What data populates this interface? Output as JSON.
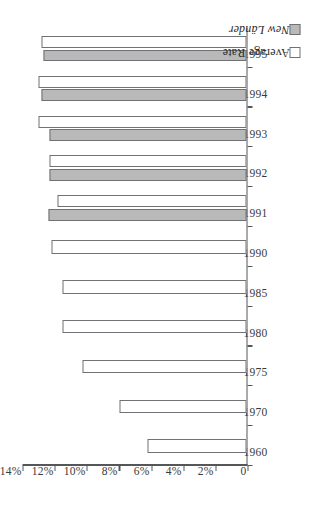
{
  "chart_data": {
    "type": "bar",
    "title": "",
    "subtitle": "",
    "xlabel": "",
    "ylabel": "",
    "orientation": "horizontal-rotated",
    "categories": [
      "1960",
      "1970",
      "1975",
      "1980",
      "1985",
      "1990",
      "1991",
      "1992",
      "1993",
      "1994",
      "1995"
    ],
    "series": [
      {
        "name": "Average Rate",
        "color": "#ffffff",
        "values": [
          6.1,
          7.9,
          10.2,
          11.4,
          11.4,
          12.1,
          11.7,
          12.25,
          12.9,
          12.9,
          12.7
        ]
      },
      {
        "name": "New Länder",
        "color": "#b9b9b9",
        "values": [
          null,
          null,
          null,
          null,
          null,
          null,
          12.3,
          12.2,
          12.2,
          12.7,
          12.6
        ]
      }
    ],
    "value_axis": {
      "ticks": [
        0,
        2,
        4,
        6,
        8,
        10,
        12,
        14
      ],
      "tick_labels": [
        "0",
        "2%",
        "4%",
        "6%",
        "8%",
        "10%",
        "12%",
        "14%"
      ],
      "min": 0,
      "max": 14,
      "unit": "%"
    },
    "grid": false,
    "legend_position": "bottom-right",
    "legend": [
      {
        "label": "Average Rate",
        "swatch": "#ffffff",
        "italic": false
      },
      {
        "label": "New Länder",
        "swatch": "#b9b9b9",
        "italic": true
      }
    ]
  },
  "colors": {
    "bar_avg_fill": "#ffffff",
    "bar_neu_fill": "#b9b9b9",
    "bar_stroke": "#6f7175",
    "axis": "#55565a",
    "text": "#2b2b2b",
    "background": "#ffffff"
  }
}
